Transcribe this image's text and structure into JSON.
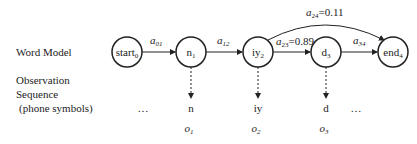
{
  "row_labels": {
    "word_model": "Word Model",
    "observation_line1": "Observation",
    "observation_line2": "Sequence",
    "observation_line3": "(phone symbols)"
  },
  "states": [
    {
      "name": "start",
      "sub": "0"
    },
    {
      "name": "n",
      "sub": "1"
    },
    {
      "name": "iy",
      "sub": "2"
    },
    {
      "name": "d",
      "sub": "3"
    },
    {
      "name": "end",
      "sub": "4"
    }
  ],
  "transitions": [
    {
      "sym": "a",
      "sub": "01",
      "value": ""
    },
    {
      "sym": "a",
      "sub": "12",
      "value": ""
    },
    {
      "sym": "a",
      "sub": "23",
      "value": "=0.89"
    },
    {
      "sym": "a",
      "sub": "34",
      "value": ""
    },
    {
      "sym": "a",
      "sub": "24",
      "value": "=0.11"
    }
  ],
  "observations": [
    {
      "phone": "n",
      "sym": "o",
      "sub": "1"
    },
    {
      "phone": "iy",
      "sym": "o",
      "sub": "2"
    },
    {
      "phone": "d",
      "sym": "o",
      "sub": "3"
    }
  ],
  "ellipsis_left": "…",
  "ellipsis_right": "…"
}
